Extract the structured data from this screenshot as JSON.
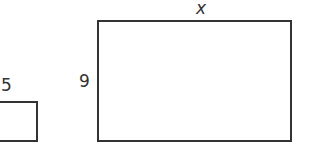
{
  "diagram": {
    "type": "similar-rectangles",
    "small_rectangle": {
      "top_label": "5"
    },
    "large_rectangle": {
      "top_label": "x",
      "side_label": "9"
    }
  },
  "colors": {
    "stroke": "#333333",
    "background": "#ffffff"
  }
}
